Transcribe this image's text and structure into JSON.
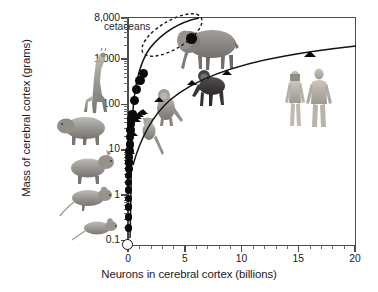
{
  "chart_data": {
    "type": "scatter",
    "title": "",
    "xlabel": "Neurons in cerebral cortex (billions)",
    "ylabel": "Mass of cerebral cortex (grams)",
    "xlim": [
      0,
      20
    ],
    "ylim": [
      0.08,
      8000
    ],
    "xscale": "linear",
    "yscale": "log",
    "grid": false,
    "legend": "none",
    "xticks": [
      0,
      5,
      10,
      15,
      20
    ],
    "xtick_labels": [
      "0",
      "5",
      "10",
      "15",
      "20"
    ],
    "x_minor_interval": 1,
    "yticks": [
      0.1,
      1,
      10,
      100,
      1000,
      8000
    ],
    "ytick_labels": [
      "0.1",
      "1",
      "10",
      "100",
      "1,000",
      "8,000"
    ],
    "annotations": [
      {
        "text": "cetaceans",
        "x": 1.1,
        "y": 5200,
        "shape": "dashed-ellipse"
      }
    ],
    "series": [
      {
        "name": "non-primate mammals",
        "marker": "filled-circle",
        "points": [
          {
            "x": 0.02,
            "y": 0.08,
            "marker": "open-circle",
            "label": "smallest"
          },
          {
            "x": 0.03,
            "y": 0.19
          },
          {
            "x": 0.035,
            "y": 0.33
          },
          {
            "x": 0.04,
            "y": 0.55
          },
          {
            "x": 0.05,
            "y": 0.85
          },
          {
            "x": 0.055,
            "y": 1.3
          },
          {
            "x": 0.06,
            "y": 1.9
          },
          {
            "x": 0.07,
            "y": 2.7
          },
          {
            "x": 0.08,
            "y": 3.8
          },
          {
            "x": 0.09,
            "y": 5.2
          },
          {
            "x": 0.1,
            "y": 7.0
          },
          {
            "x": 0.12,
            "y": 9.5
          },
          {
            "x": 0.15,
            "y": 13
          },
          {
            "x": 0.18,
            "y": 19
          },
          {
            "x": 0.22,
            "y": 27
          },
          {
            "x": 0.28,
            "y": 38
          },
          {
            "x": 0.32,
            "y": 48
          },
          {
            "x": 0.4,
            "y": 62
          },
          {
            "x": 0.55,
            "y": 120
          },
          {
            "x": 0.75,
            "y": 215
          },
          {
            "x": 1.05,
            "y": 330
          },
          {
            "x": 1.35,
            "y": 470
          },
          {
            "x": 5.6,
            "y": 2800,
            "label": "elephant"
          }
        ]
      },
      {
        "name": "primates",
        "marker": "filled-triangle",
        "points": [
          {
            "x": 0.21,
            "y": 9.0
          },
          {
            "x": 0.45,
            "y": 22
          },
          {
            "x": 0.72,
            "y": 45
          },
          {
            "x": 0.82,
            "y": 52
          },
          {
            "x": 0.95,
            "y": 58
          },
          {
            "x": 1.15,
            "y": 62
          },
          {
            "x": 1.3,
            "y": 66
          },
          {
            "x": 2.75,
            "y": 125
          },
          {
            "x": 5.6,
            "y": 290
          },
          {
            "x": 8.7,
            "y": 480
          },
          {
            "x": 16.0,
            "y": 1200,
            "label": "human"
          }
        ]
      }
    ],
    "trend_lines": [
      {
        "name": "non-primate fit",
        "style": "solid"
      },
      {
        "name": "primate fit",
        "style": "solid"
      }
    ],
    "images": [
      {
        "name": "giraffe",
        "x": 0.05,
        "y": 900
      },
      {
        "name": "elephant",
        "x": 6.5,
        "y": 2400
      },
      {
        "name": "chimpanzee",
        "x": 6.1,
        "y": 330
      },
      {
        "name": "monkey",
        "x": 3.6,
        "y": 60
      },
      {
        "name": "lemur",
        "x": 2.1,
        "y": 5.5
      },
      {
        "name": "capybara",
        "x": -1.6,
        "y": 18
      },
      {
        "name": "agouti",
        "x": -1.6,
        "y": 2.2
      },
      {
        "name": "rat",
        "x": -1.6,
        "y": 0.55
      },
      {
        "name": "mouse",
        "x": -1.3,
        "y": 0.13
      },
      {
        "name": "human-female",
        "x": 13.6,
        "y": 230
      },
      {
        "name": "human-male",
        "x": 15.6,
        "y": 230
      }
    ]
  }
}
